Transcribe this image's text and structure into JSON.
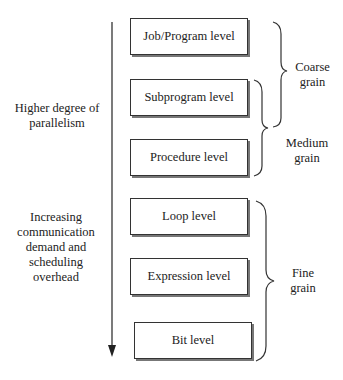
{
  "diagram": {
    "left_labels": {
      "top": "Higher degree of parallelism",
      "top_line1": "Higher degree of",
      "top_line2": "parallelism",
      "bottom_line1": "Increasing",
      "bottom_line2": "communication",
      "bottom_line3": "demand and",
      "bottom_line4": "scheduling",
      "bottom_line5": "overhead"
    },
    "levels": [
      {
        "label": "Job/Program level"
      },
      {
        "label": "Subprogram level"
      },
      {
        "label": "Procedure level"
      },
      {
        "label": "Loop level"
      },
      {
        "label": "Expression level"
      },
      {
        "label": "Bit level"
      }
    ],
    "grains": {
      "coarse_line1": "Coarse",
      "coarse_line2": "grain",
      "medium_line1": "Medium",
      "medium_line2": "grain",
      "fine_line1": "Fine",
      "fine_line2": "grain"
    }
  }
}
